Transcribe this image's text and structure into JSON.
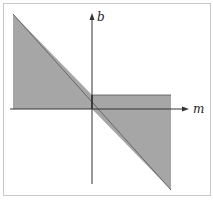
{
  "figure": {
    "axes": {
      "x_label": "m",
      "y_label": "b"
    },
    "colors": {
      "shade": "#a6a6a6",
      "axis": "#333333",
      "frame": "#c8c8c8",
      "outline": "#444444"
    },
    "regions": [
      {
        "name": "upper-left-region",
        "description": "area between diagonal line and m-axis for m < 0"
      },
      {
        "name": "strip-region",
        "description": "thin horizontal strip above m-axis for m > 0"
      },
      {
        "name": "lower-right-region",
        "description": "area between m-axis and diagonal line for m > 0"
      }
    ]
  }
}
